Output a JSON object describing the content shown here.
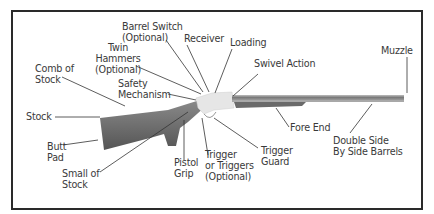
{
  "diagram": {
    "colors": {
      "frame": "#2a2a2a",
      "text": "#3a3a3a",
      "leader": "#333333",
      "wood": "#6e6e6e",
      "wood_dark": "#555555",
      "metal": "#e6e6e6",
      "barrel": "#8a8a8a"
    },
    "labels": {
      "barrel_switch": "Barrel Switch\n(Optional)",
      "receiver": "Receiver",
      "loading": "Loading",
      "swivel_action": "Swivel Action",
      "muzzle": "Muzzle",
      "twin_hammers": "Twin\nHammers\n(Optional)",
      "comb_of_stock": "Comb of\nStock",
      "safety_mechanism": "Safety\nMechanism",
      "stock": "Stock",
      "butt_pad": "Butt\nPad",
      "small_of_stock": "Small of\nStock",
      "pistol_grip": "Pistol\nGrip",
      "trigger": "Trigger\nor Triggers\n(Optional)",
      "trigger_guard": "Trigger\nGuard",
      "fore_end": "Fore End",
      "double_side_barrels": "Double Side\nBy Side Barrels"
    }
  }
}
